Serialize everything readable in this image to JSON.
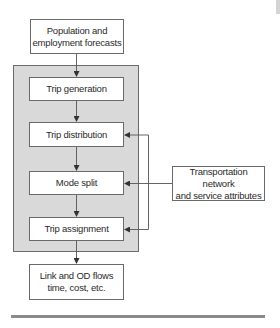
{
  "diagram": {
    "nodes": {
      "input": "Population and employment forecasts",
      "input_line1": "Population and",
      "input_line2": "employment forecasts",
      "trip_generation": "Trip generation",
      "trip_distribution": "Trip distribution",
      "mode_split": "Mode split",
      "trip_assignment": "Trip assignment",
      "output_line1": "Link and OD flows",
      "output_line2": "time, cost, etc.",
      "network_line1": "Transportation network",
      "network_line2": "and service attributes"
    },
    "group": "four-step model",
    "edges": [
      [
        "Population and employment forecasts",
        "Trip generation"
      ],
      [
        "Trip generation",
        "Trip distribution"
      ],
      [
        "Trip distribution",
        "Mode split"
      ],
      [
        "Mode split",
        "Trip assignment"
      ],
      [
        "Trip assignment",
        "Link and OD flows time, cost, etc."
      ],
      [
        "Transportation network and service attributes",
        "Trip distribution"
      ],
      [
        "Transportation network and service attributes",
        "Mode split"
      ],
      [
        "Transportation network and service attributes",
        "Trip assignment"
      ]
    ],
    "colors": {
      "group_fill": "#d9d9d9",
      "border": "#6a6a6a",
      "rule": "#8a8a8a"
    }
  }
}
